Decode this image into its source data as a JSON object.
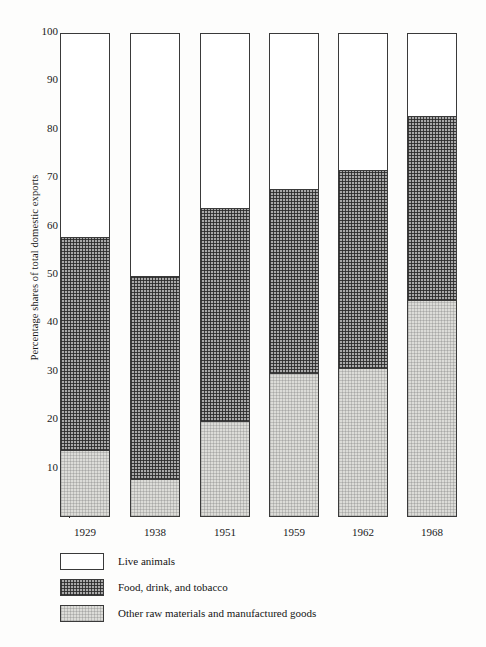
{
  "chart_data": {
    "type": "bar",
    "subtype": "stacked-bar-100-percent",
    "title": "",
    "xlabel": "",
    "ylabel": "Percentage shares of total domestic exports",
    "ylim": [
      0,
      100
    ],
    "yticks": [
      10,
      20,
      30,
      40,
      50,
      60,
      70,
      80,
      90,
      100
    ],
    "ytick_labels": [
      "10",
      "20",
      "30",
      "40",
      "50",
      "60",
      "70",
      "80",
      "90",
      "100"
    ],
    "grid": false,
    "legend_position": "bottom-left",
    "categories": [
      "1929",
      "1938",
      "1951",
      "1959",
      "1962",
      "1968"
    ],
    "series": [
      {
        "name": "Live animals",
        "pattern": "white",
        "values": [
          42,
          50,
          36,
          32,
          28,
          17
        ]
      },
      {
        "name": "Food, drink, and tobacco",
        "pattern": "dark-crosshatch",
        "values": [
          44,
          42,
          44,
          38,
          41,
          38
        ]
      },
      {
        "name": "Other raw materials and manufactured goods",
        "pattern": "light-stipple",
        "values": [
          14,
          8,
          20,
          30,
          31,
          45
        ]
      }
    ],
    "cumulative_boundaries": {
      "note": "upper edge of each stack segment, read off the y-axis",
      "1929": {
        "other_raw_top": 14,
        "food_drink_top": 58,
        "live_animals_top": 100
      },
      "1938": {
        "other_raw_top": 8,
        "food_drink_top": 50,
        "live_animals_top": 100
      },
      "1951": {
        "other_raw_top": 20,
        "food_drink_top": 64,
        "live_animals_top": 100
      },
      "1959": {
        "other_raw_top": 30,
        "food_drink_top": 68,
        "live_animals_top": 100
      },
      "1962": {
        "other_raw_top": 31,
        "food_drink_top": 72,
        "live_animals_top": 100
      },
      "1968": {
        "other_raw_top": 45,
        "food_drink_top": 83,
        "live_animals_top": 100
      }
    }
  },
  "legend": {
    "items": [
      {
        "label": "Live animals"
      },
      {
        "label": "Food, drink, and tobacco"
      },
      {
        "label": "Other raw materials and manufactured goods"
      }
    ]
  },
  "colors": {
    "axis": "#2a2a2a",
    "bar_outline": "#3a3a3a",
    "live_animals": "#ffffff",
    "food_drink_tobacco": "#a9a9a9",
    "other_raw_materials": "#dcdcd8",
    "page_background": "#fdfdfc"
  }
}
